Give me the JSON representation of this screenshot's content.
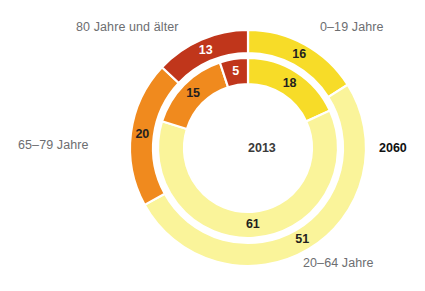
{
  "figure": {
    "background": "#ffffff",
    "label_color": "#6d6e71",
    "value_dark": "#231f20",
    "value_light": "#ffffff",
    "ring_gap_color": "#ffffff"
  },
  "labels": {
    "age_80_plus": "80 Jahre und älter",
    "age_0_19": "0–19 Jahre",
    "age_65_79": "65–79 Jahre",
    "age_20_64": "20–64 Jahre",
    "year_inner": "2013",
    "year_outer": "2060"
  },
  "colors": {
    "age_0_19": "#F7DC28",
    "age_20_64": "#FAF49A",
    "age_65_79": "#F08A1E",
    "age_80_plus": "#C0361B"
  },
  "values": {
    "outer": {
      "age_0_19": "16",
      "age_20_64": "51",
      "age_65_79": "20",
      "age_80_plus": "13"
    },
    "inner": {
      "age_0_19": "18",
      "age_20_64": "61",
      "age_65_79": "15",
      "age_80_plus": "5"
    }
  },
  "chart_data": {
    "type": "pie",
    "title": "",
    "subtype": "nested-donut",
    "categories": [
      "0–19 Jahre",
      "20–64 Jahre",
      "65–79 Jahre",
      "80 Jahre und älter"
    ],
    "unit": "%",
    "start_angle_deg": 0,
    "direction": "clockwise",
    "legend_position": "around-chart",
    "grid": false,
    "series": [
      {
        "name": "2013",
        "ring": "inner",
        "values": [
          18,
          61,
          15,
          5
        ],
        "labels": [
          "18",
          "61",
          "15",
          "5"
        ]
      },
      {
        "name": "2060",
        "ring": "outer",
        "values": [
          16,
          51,
          20,
          13
        ],
        "labels": [
          "16",
          "51",
          "20",
          "13"
        ]
      }
    ],
    "colors": [
      "#F7DC28",
      "#FAF49A",
      "#F08A1E",
      "#C0361B"
    ],
    "annotations": [
      "2013",
      "2060"
    ]
  },
  "geometry": {
    "cx": 248,
    "cy": 148,
    "outer_ring": {
      "r_outer": 118,
      "r_inner": 95
    },
    "inner_ring": {
      "r_outer": 90,
      "r_inner": 64
    },
    "label_radius_outer": 106.5,
    "label_radius_inner": 77
  }
}
